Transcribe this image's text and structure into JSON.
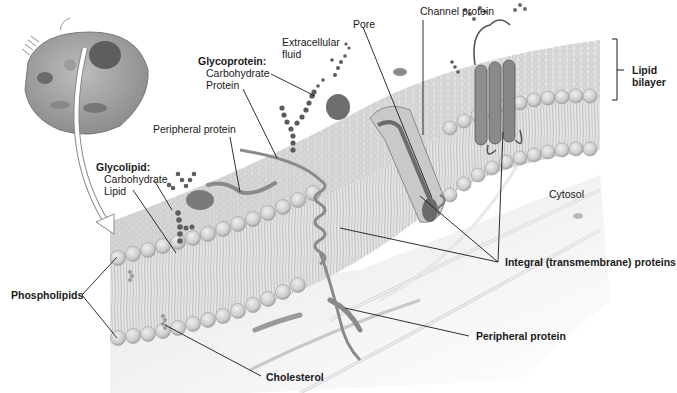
{
  "diagram": {
    "colors": {
      "background": "#ffffff",
      "membrane_surface": "#d8d8d8",
      "phospholipid_head": "#cfcfcf",
      "phospholipid_head_shade": "#a9a9a9",
      "protein": "#8a8a8a",
      "protein_dark": "#5e5e5e",
      "carbohydrate": "#6a6a6a",
      "cytosol": "#e6e6e6",
      "leader_line": "#1a1a1a",
      "label_text": "#1a1a1a"
    },
    "labels": {
      "extracellular_fluid": "Extracellular fluid",
      "extracellular_fluid_line1": "Extracellular",
      "extracellular_fluid_line2": "fluid",
      "pore": "Pore",
      "channel_protein": "Channel protein",
      "lipid_bilayer_line1": "Lipid",
      "lipid_bilayer_line2": "bilayer",
      "glycoprotein": "Glycoprotein:",
      "glycoprotein_carbohydrate": "Carbohydrate",
      "glycoprotein_protein": "Protein",
      "peripheral_protein_top": "Peripheral protein",
      "glycolipid": "Glycolipid:",
      "glycolipid_carbohydrate": "Carbohydrate",
      "glycolipid_lipid": "Lipid",
      "cytosol": "Cytosol",
      "integral_proteins": "Integral (transmembrane) proteins",
      "phospholipids": "Phospholipids",
      "peripheral_protein_bottom": "Peripheral protein",
      "cholesterol": "Cholesterol"
    },
    "inset": {
      "description": "Whole animal cell inset",
      "arrow": "curved-arrow-pointing-to-membrane"
    }
  }
}
